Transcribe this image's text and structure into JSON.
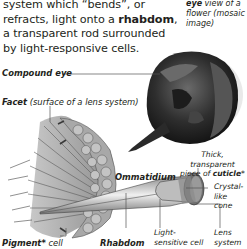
{
  "paragraph": {
    "line1": "system which “bends”, or",
    "line2_pre": "refracts, light onto a ",
    "line2_bold": "rhabdom",
    "line2_post": ",",
    "line3": "a transparent rod surrounded",
    "line4": "by light-responsive cells."
  },
  "caption_top_right": {
    "bold": "eye",
    "rest": " view of a flower (mosaic image)"
  },
  "labels": {
    "compound_eye": "Compound eye",
    "facet_bold": "Facet",
    "facet_note": " (surface of a lens system)",
    "ommatidium": "Ommatidium",
    "thick_line1": "Thick, transparent",
    "thick_line2_pre": "piece of ",
    "thick_line2_bold": "cuticle",
    "thick_line2_star": "*",
    "crystal_line1": "Crystal-",
    "crystal_line2": "like cone",
    "light_line1": "Light-",
    "light_line2": "sensitive cell",
    "lens_line1": "Lens",
    "lens_line2": "system",
    "pigment_bold": "Pigment*",
    "pigment_rest": " cell",
    "rhabdom": "Rhabdom"
  },
  "colors": {
    "text": "#231f20",
    "leader": "#555555",
    "art_dark": "#3a3a3a",
    "art_mid": "#9a9a9a",
    "art_light": "#d8d8d8"
  }
}
